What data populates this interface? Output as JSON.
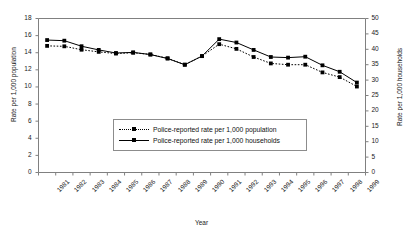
{
  "chart_data": {
    "type": "line",
    "title": "",
    "xlabel": "Year",
    "ylabel": "Rate per 1,000 population",
    "ylabel_secondary": "Rate per 1,000 households",
    "grid": false,
    "legend_position": "center",
    "categories": [
      "1981",
      "1982",
      "1983",
      "1984",
      "1985",
      "1986",
      "1987",
      "1988",
      "1989",
      "1990",
      "1991",
      "1992",
      "1993",
      "1994",
      "1995",
      "1996",
      "1997",
      "1998",
      "1999"
    ],
    "ylim": [
      0,
      18
    ],
    "ytick_labels": [
      "0",
      "2",
      "4",
      "6",
      "8",
      "10",
      "12",
      "14",
      "16",
      "18"
    ],
    "ylim_secondary": [
      0,
      50
    ],
    "ytick_labels_secondary": [
      "0",
      "5",
      "10",
      "15",
      "20",
      "25",
      "30",
      "35",
      "40",
      "45",
      "50"
    ],
    "series": [
      {
        "name": "Police-reported rate per 1,000 population",
        "axis": "left",
        "style": "dotted",
        "marker": "square",
        "color": "#000000",
        "values": [
          14.8,
          14.75,
          14.35,
          14.1,
          13.9,
          14.0,
          13.8,
          13.35,
          12.6,
          13.6,
          15.0,
          14.45,
          13.5,
          12.75,
          12.6,
          12.6,
          11.7,
          11.15,
          10.05
        ]
      },
      {
        "name": "Police-reported rate per 1,000 households",
        "axis": "right",
        "style": "solid",
        "marker": "square",
        "color": "#000000",
        "values": [
          43.0,
          42.8,
          41.0,
          39.8,
          38.8,
          39.0,
          38.3,
          37.0,
          35.0,
          37.8,
          43.3,
          42.2,
          39.8,
          37.5,
          37.3,
          37.6,
          34.8,
          32.7,
          29.2
        ]
      }
    ]
  },
  "legend": {
    "items": [
      {
        "label": "Police-reported rate per 1,000 population"
      },
      {
        "label": "Police-reported rate per 1,000 households"
      }
    ]
  }
}
